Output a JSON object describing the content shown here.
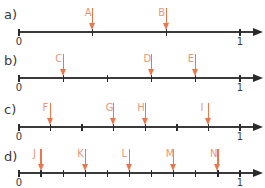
{
  "colors": {
    "axis": "#2a2a2a",
    "marker_arrow": "#e8784a",
    "marker_letter": "#e8987a",
    "text": "#3a3a3a"
  },
  "panels": [
    {
      "label": "a)",
      "divisions": 3,
      "start_label": "0",
      "end_label": "1",
      "markers": [
        {
          "letter": "A",
          "position": "1/3"
        },
        {
          "letter": "B",
          "position": "2/3"
        }
      ]
    },
    {
      "label": "b)",
      "divisions": 5,
      "start_label": "0",
      "end_label": "1",
      "markers": [
        {
          "letter": "C",
          "position": "1/5"
        },
        {
          "letter": "D",
          "position": "3/5"
        },
        {
          "letter": "E",
          "position": "4/5"
        }
      ]
    },
    {
      "label": "c)",
      "divisions": 7,
      "start_label": "0",
      "end_label": "1",
      "markers": [
        {
          "letter": "F",
          "position": "1/7"
        },
        {
          "letter": "G",
          "position": "3/7"
        },
        {
          "letter": "H",
          "position": "4/7"
        },
        {
          "letter": "I",
          "position": "6/7"
        }
      ]
    },
    {
      "label": "d)",
      "divisions": 10,
      "start_label": "0",
      "end_label": "1",
      "markers": [
        {
          "letter": "J",
          "position": "1/10"
        },
        {
          "letter": "K",
          "position": "3/10"
        },
        {
          "letter": "L",
          "position": "5/10"
        },
        {
          "letter": "M",
          "position": "7/10"
        },
        {
          "letter": "N",
          "position": "9/10"
        }
      ]
    }
  ]
}
